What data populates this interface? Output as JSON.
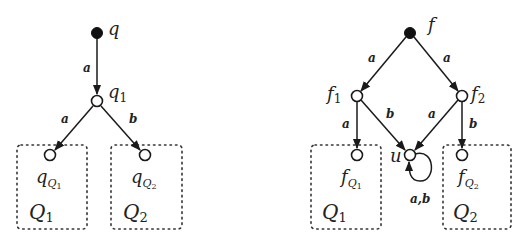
{
  "left_automaton": {
    "states": [
      {
        "id": "q",
        "label": "q",
        "type": "initial"
      },
      {
        "id": "q1",
        "label": "q",
        "sub": "1",
        "type": "normal"
      },
      {
        "id": "qQ1",
        "label": "q",
        "sub": "Q",
        "subsub": "1",
        "type": "normal"
      },
      {
        "id": "qQ2",
        "label": "q",
        "sub": "Q",
        "subsub": "2",
        "type": "normal"
      }
    ],
    "transitions": [
      {
        "from": "q",
        "to": "q1",
        "label": "a"
      },
      {
        "from": "q1",
        "to": "qQ1",
        "label": "a"
      },
      {
        "from": "q1",
        "to": "qQ2",
        "label": "b"
      }
    ],
    "regions": [
      {
        "id": "Q1",
        "label": "Q",
        "sub": "1"
      },
      {
        "id": "Q2",
        "label": "Q",
        "sub": "2"
      }
    ]
  },
  "right_automaton": {
    "states": [
      {
        "id": "f",
        "label": "f",
        "type": "initial"
      },
      {
        "id": "f1",
        "label": "f",
        "sub": "1",
        "type": "normal"
      },
      {
        "id": "f2",
        "label": "f",
        "sub": "2",
        "type": "normal"
      },
      {
        "id": "fQ1",
        "label": "f",
        "sub": "Q",
        "subsub": "1",
        "type": "normal"
      },
      {
        "id": "u",
        "label": "u",
        "type": "normal"
      },
      {
        "id": "fQ2",
        "label": "f",
        "sub": "Q",
        "subsub": "2",
        "type": "normal"
      }
    ],
    "transitions": [
      {
        "from": "f",
        "to": "f1",
        "label": "a"
      },
      {
        "from": "f",
        "to": "f2",
        "label": "a"
      },
      {
        "from": "f1",
        "to": "fQ1",
        "label": "a"
      },
      {
        "from": "f1",
        "to": "u",
        "label": "b"
      },
      {
        "from": "f2",
        "to": "u",
        "label": "a"
      },
      {
        "from": "f2",
        "to": "fQ2",
        "label": "b"
      },
      {
        "from": "u",
        "to": "u",
        "label": "a,b"
      }
    ],
    "regions": [
      {
        "id": "Q1",
        "label": "Q",
        "sub": "1"
      },
      {
        "id": "Q2",
        "label": "Q",
        "sub": "2"
      }
    ]
  }
}
